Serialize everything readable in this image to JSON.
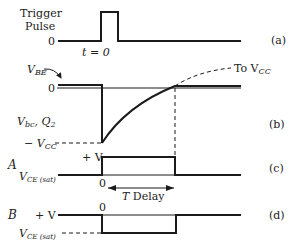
{
  "panels": {
    "a": {
      "title_line1": "Trigger",
      "title_line2": "Pulse",
      "zero_label": "0",
      "time_label": "t = 0",
      "panel_label": "(a)"
    },
    "b": {
      "vbe_label": "V",
      "vbe_sub": "BE",
      "zero_label": "0",
      "signal_label": "V",
      "signal_sub": "bc",
      "signal_suffix": ", Q",
      "signal_suffix_sub": "2",
      "neg_vcc_prefix": "− V",
      "neg_vcc_sub": "CC",
      "to_vcc_prefix": "To V",
      "to_vcc_sub": "CC",
      "panel_label": "(b)"
    },
    "c": {
      "row_label": "A",
      "high_label": "+ V",
      "low_label": "V",
      "low_sub": "CE (sat)",
      "zero_label": "0",
      "delay_label_t": "T",
      "delay_label": " Delay",
      "panel_label": "(c)"
    },
    "d": {
      "row_label": "B",
      "high_label": "+ V",
      "low_label": "V",
      "low_sub": "CE (sat)",
      "zero_label": "0",
      "panel_label": "(d)"
    }
  },
  "colors": {
    "line": "#1a1a1a",
    "text": "#222222"
  }
}
